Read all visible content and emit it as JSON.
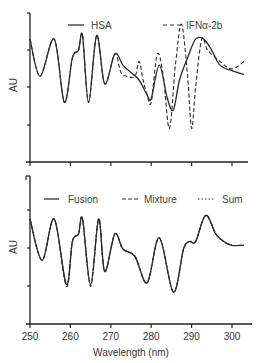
{
  "chart_data": [
    {
      "type": "line",
      "title": "",
      "xlabel": "",
      "ylabel": "AU",
      "xlim": [
        250,
        303
      ],
      "ylim": [
        0,
        4
      ],
      "grid": false,
      "legend_position": "top",
      "legend": [
        "HSA",
        "IFNα-2b"
      ],
      "series": [
        {
          "name": "HSA",
          "style": "solid",
          "x": [
            250,
            252.5,
            256,
            258.5,
            260.5,
            262,
            263,
            264.5,
            266.5,
            268.5,
            271,
            273,
            275,
            277,
            279,
            280,
            282,
            284,
            285.5,
            287,
            289,
            291,
            293,
            295,
            297,
            300,
            303
          ],
          "y": [
            3.3,
            2.3,
            3.3,
            1.6,
            2.8,
            3.0,
            3.4,
            1.6,
            3.4,
            2.1,
            2.9,
            2.6,
            2.4,
            2.2,
            1.8,
            1.7,
            2.6,
            1.7,
            1.4,
            2.2,
            2.8,
            3.3,
            3.3,
            3.0,
            2.6,
            2.45,
            2.35
          ]
        },
        {
          "name": "IFNα-2b",
          "style": "dashed",
          "x": [
            250,
            252.5,
            256,
            258.5,
            260.5,
            262,
            263,
            264.5,
            266.5,
            268.5,
            271,
            272.5,
            274,
            276,
            277,
            278,
            279,
            280,
            281.5,
            283,
            284.5,
            286,
            287.5,
            289,
            290,
            291,
            292.5,
            294,
            297,
            300,
            303
          ],
          "y": [
            3.3,
            2.3,
            3.3,
            1.6,
            2.8,
            3.0,
            3.4,
            1.6,
            3.4,
            2.1,
            2.9,
            2.4,
            2.3,
            2.3,
            2.7,
            2.2,
            1.8,
            1.6,
            2.9,
            2.3,
            0.9,
            2.6,
            3.7,
            2.3,
            0.9,
            2.0,
            3.3,
            3.0,
            2.7,
            2.5,
            2.7
          ]
        }
      ]
    },
    {
      "type": "line",
      "title": "",
      "xlabel": "Wavelength (nm)",
      "ylabel": "AU",
      "xlim": [
        250,
        303
      ],
      "ylim": [
        0,
        4
      ],
      "grid": false,
      "legend_position": "top",
      "legend": [
        "Fusion",
        "Mixture",
        "Sum"
      ],
      "x_ticks": [
        250,
        260,
        270,
        280,
        290,
        300
      ],
      "series": [
        {
          "name": "Fusion",
          "style": "solid",
          "x": [
            250,
            253,
            256,
            259,
            260.5,
            262,
            263,
            265,
            267,
            268.5,
            271,
            273,
            276,
            279,
            282,
            285.5,
            288,
            289.5,
            291,
            293.5,
            296,
            298,
            300,
            303
          ],
          "y": [
            2.8,
            1.7,
            2.8,
            1.05,
            2.2,
            2.4,
            2.8,
            1.05,
            2.8,
            1.4,
            2.4,
            2.0,
            1.8,
            1.1,
            2.3,
            0.85,
            2.0,
            2.2,
            2.2,
            2.9,
            2.4,
            2.2,
            2.1,
            2.1
          ]
        },
        {
          "name": "Mixture",
          "style": "dashed",
          "x": [
            250,
            253,
            256,
            259,
            260.5,
            262,
            263,
            265,
            267,
            268.5,
            271,
            273,
            276,
            279,
            282,
            285.5,
            288,
            289.5,
            291,
            293.5,
            296,
            298,
            300,
            303
          ],
          "y": [
            2.8,
            1.7,
            2.8,
            1.0,
            2.2,
            2.4,
            2.8,
            1.0,
            2.8,
            1.4,
            2.4,
            2.0,
            1.8,
            1.1,
            2.3,
            0.85,
            2.0,
            2.2,
            2.2,
            2.9,
            2.4,
            2.2,
            2.1,
            2.1
          ]
        },
        {
          "name": "Sum",
          "style": "dotted",
          "x": [
            250,
            253,
            256,
            259,
            260.5,
            262,
            263,
            265,
            267,
            268.5,
            271,
            273,
            276,
            279,
            282,
            285.5,
            288,
            289.5,
            291,
            293.5,
            296,
            298,
            300,
            303
          ],
          "y": [
            2.8,
            1.7,
            2.8,
            1.05,
            2.2,
            2.4,
            2.8,
            1.05,
            2.8,
            1.4,
            2.4,
            2.0,
            1.8,
            1.1,
            2.3,
            0.85,
            2.0,
            2.2,
            2.2,
            2.9,
            2.4,
            2.2,
            2.1,
            2.1
          ]
        }
      ]
    }
  ],
  "labels": {
    "top_ylabel": "AU",
    "bottom_ylabel": "AU",
    "xlabel": "Wavelength (nm)",
    "x_ticks": [
      "250",
      "260",
      "270",
      "280",
      "290",
      "300"
    ],
    "top_legend": [
      "HSA",
      "IFNα-2b"
    ],
    "bottom_legend": [
      "Fusion",
      "Mixture",
      "Sum"
    ]
  }
}
